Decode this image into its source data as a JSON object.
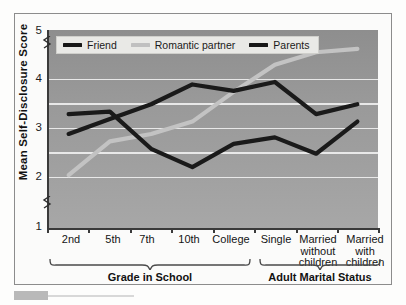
{
  "chart_data": {
    "type": "line",
    "title": "",
    "xlabel": "",
    "ylabel": "Mean Self-Disclosure Score",
    "ylim": [
      1,
      5
    ],
    "yticks": [
      1,
      2,
      3,
      4,
      5
    ],
    "ytick_labels": [
      "1",
      "2",
      "3",
      "4",
      "5"
    ],
    "gridlines": [
      2,
      2.5,
      3,
      3.5,
      4
    ],
    "grid": true,
    "axis_break": true,
    "legend_position": "top-left inside plot",
    "categories": [
      "2nd",
      "5th",
      "7th",
      "10th",
      "College",
      "Single",
      "Married without children",
      "Married with children"
    ],
    "category_labels_multiline": [
      [
        "2nd"
      ],
      [
        "5th"
      ],
      [
        "7th"
      ],
      [
        "10th"
      ],
      [
        "College"
      ],
      [
        "Single"
      ],
      [
        "Married",
        "without",
        "children"
      ],
      [
        "Married",
        "with",
        "children"
      ]
    ],
    "series": [
      {
        "name": "Friend",
        "color": "#1a1a1a",
        "values": [
          2.9,
          3.2,
          3.5,
          3.9,
          3.77,
          3.95,
          3.3,
          3.5
        ]
      },
      {
        "name": "Romantic partner",
        "color": "#c3c3c3",
        "values": [
          2.07,
          2.75,
          2.9,
          3.15,
          3.75,
          4.3,
          4.55,
          4.62
        ]
      },
      {
        "name": "Parents",
        "color": "#1a1a1a",
        "values": [
          3.3,
          3.35,
          2.6,
          2.23,
          2.7,
          2.83,
          2.5,
          3.15
        ]
      }
    ],
    "groups": [
      {
        "label": "Grade in School",
        "from": 0,
        "to": 4
      },
      {
        "label": "Adult Marital Status",
        "from": 5,
        "to": 7
      }
    ]
  },
  "legend": {
    "items": [
      {
        "label": "Friend",
        "color": "#1a1a1a"
      },
      {
        "label": "Romantic partner",
        "color": "#c3c3c3"
      },
      {
        "label": "Parents",
        "color": "#1a1a1a"
      }
    ]
  }
}
